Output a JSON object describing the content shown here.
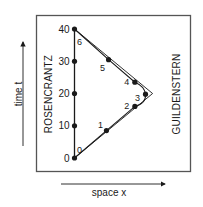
{
  "diagram": {
    "type": "spacetime-diagram",
    "axes": {
      "time_label": "time t",
      "space_label": "space x"
    },
    "observers": {
      "left": "ROSENCRANTZ",
      "right": "GUILDENSTERN"
    },
    "time_ticks": [
      "0",
      "10",
      "20",
      "30",
      "40"
    ],
    "time_tick_values": [
      0,
      10,
      20,
      30,
      40
    ],
    "worldlines": [
      {
        "name": "rosencrantz-worldline",
        "description": "vertical line at x=0 from t=0 to t=40",
        "points": [
          [
            0,
            0
          ],
          [
            0,
            40
          ]
        ]
      },
      {
        "name": "light-signal-path",
        "description": "straight out-and-back triangle",
        "points": [
          [
            0,
            0
          ],
          [
            11,
            20
          ],
          [
            0,
            40
          ]
        ]
      },
      {
        "name": "guildenstern-worldline",
        "description": "curved out-and-back path with events 0-6",
        "points": [
          [
            0,
            0
          ],
          [
            4.5,
            8.5
          ],
          [
            8.5,
            16
          ],
          [
            10,
            19.8
          ],
          [
            8.5,
            23.5
          ],
          [
            4.8,
            30.5
          ],
          [
            0,
            40
          ]
        ]
      }
    ],
    "events": [
      {
        "label": "0",
        "t": 0
      },
      {
        "label": "1",
        "t": 8.5
      },
      {
        "label": "2",
        "t": 16
      },
      {
        "label": "3",
        "t": 19.8
      },
      {
        "label": "4",
        "t": 23.5
      },
      {
        "label": "5",
        "t": 30.5
      },
      {
        "label": "6",
        "t": 40
      }
    ],
    "colors": {
      "ink": "#1a1a1a",
      "frame": "#555555"
    }
  }
}
